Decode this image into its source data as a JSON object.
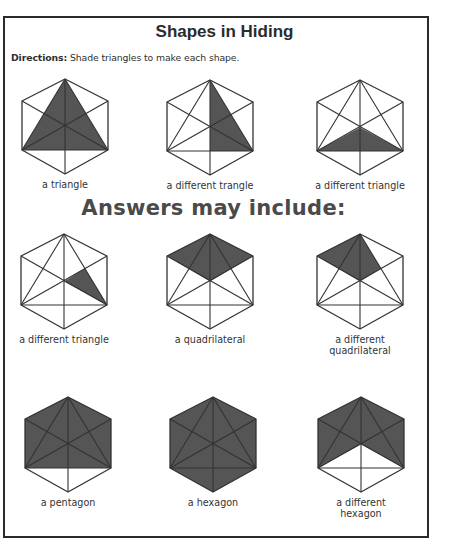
{
  "worksheet": {
    "title": "Shapes in Hiding",
    "directions_label": "Directions:",
    "directions_text": " Shade triangles to make each shape.",
    "answers_heading": "Answers may include:"
  },
  "colors": {
    "shade": "#555555",
    "line": "#333333",
    "frame": "#2b2b2b"
  },
  "hexagon_model": {
    "vertices": {
      "T": [
        43,
        0
      ],
      "UL": [
        0,
        22
      ],
      "UR": [
        86,
        22
      ],
      "LL": [
        0,
        71
      ],
      "LR": [
        86,
        71
      ],
      "B": [
        43,
        95
      ],
      "C": [
        43,
        47.5
      ]
    },
    "inner_lines": [
      [
        "T",
        "LL"
      ],
      [
        "T",
        "LR"
      ],
      [
        "LL",
        "LR"
      ],
      [
        "UL",
        "LR"
      ],
      [
        "UR",
        "LL"
      ],
      [
        "T",
        "B"
      ]
    ]
  },
  "figures": [
    {
      "caption": "a triangle",
      "x": 22,
      "y": 79,
      "shade": "43,0 86,71 0,71"
    },
    {
      "caption": "a different trangle",
      "x": 167,
      "y": 80,
      "shade": "43,0 86,71 43,71"
    },
    {
      "caption": "a different triangle",
      "x": 317,
      "y": 80,
      "shade": "43,47.5 86,71 0,71"
    },
    {
      "caption": "a different triangle",
      "x": 21,
      "y": 234,
      "shade": "43,47.5 63.9,34.6 86,71"
    },
    {
      "caption": "a quadrilateral",
      "x": 167,
      "y": 234,
      "shade": "0,22 43,0 86,22 43,47.5"
    },
    {
      "caption": "a different quadrilateral",
      "caption_line1": "a different",
      "caption_line2": "quadrilateral",
      "x": 317,
      "y": 234,
      "shade": "0,22 43,0 63.9,34.6 43,47.5"
    },
    {
      "caption": "a pentagon",
      "x": 25,
      "y": 397,
      "shade": "43,0 86,22 86,71 0,71 0,22"
    },
    {
      "caption": "a hexagon",
      "x": 170,
      "y": 397,
      "shade": "43,0 86,22 86,71 43,95 0,71 0,22"
    },
    {
      "caption": "a different hexagon",
      "caption_line1": "a different",
      "caption_line2": "hexagon",
      "x": 318,
      "y": 397,
      "shade": "0,22 43,0 86,22 86,71 43,47.5 0,71"
    }
  ]
}
